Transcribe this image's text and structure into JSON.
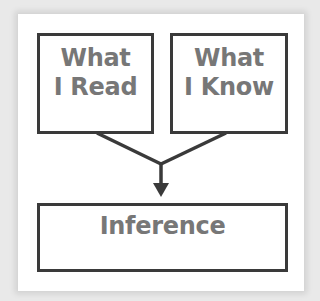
{
  "diagram": {
    "boxes": {
      "read": {
        "line1": "What",
        "line2": "I Read"
      },
      "know": {
        "line1": "What",
        "line2": "I Know"
      },
      "inference": {
        "label": "Inference"
      }
    },
    "edges": [
      {
        "from": "read",
        "to": "inference"
      },
      {
        "from": "know",
        "to": "inference"
      }
    ],
    "colors": {
      "border": "#3a3a3a",
      "text": "#777777",
      "background": "#ffffff",
      "page": "#e9e9e9"
    }
  }
}
